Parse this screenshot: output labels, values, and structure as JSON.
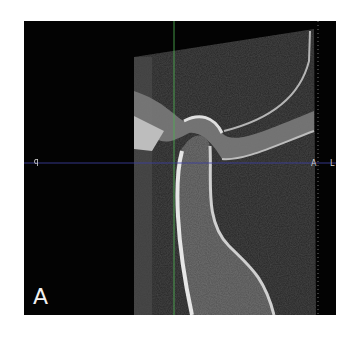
{
  "figure": {
    "panel_label": "A",
    "view": "sagittal CBCT of temporomandibular joint condyle",
    "orientation_markers": {
      "left": "P",
      "right": "A",
      "far_right": "L"
    },
    "crosshair": {
      "vertical_color": "#4caf50",
      "horizontal_color": "#3c3fa0"
    },
    "colors": {
      "background": "#030303",
      "bone": "#c8c8c8",
      "page": "#ffffff"
    }
  }
}
